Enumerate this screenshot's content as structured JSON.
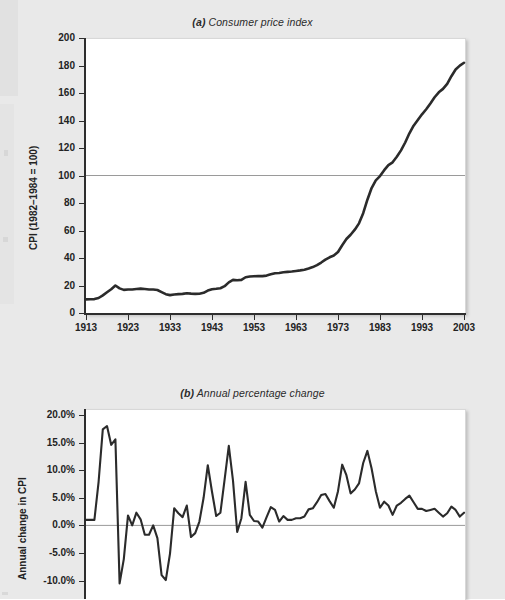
{
  "page": {
    "background_color": "#e9e9e9",
    "plot_background_color": "#ffffff",
    "line_color": "#2b2b2b",
    "reference_line_color": "#9a9a9a"
  },
  "figures": [
    {
      "id": "figure-a",
      "label": "(a)",
      "title": "Consumer price index",
      "title_full": "(a) Consumer price index",
      "ylabel": "CPI (1982–1984 = 100)",
      "xlabel": "",
      "yticks": [
        "0",
        "20",
        "40",
        "60",
        "80",
        "100",
        "120",
        "140",
        "160",
        "180",
        "200"
      ],
      "xticks": [
        "1913",
        "1923",
        "1933",
        "1943",
        "1953",
        "1963",
        "1973",
        "1983",
        "1993",
        "2003"
      ]
    },
    {
      "id": "figure-b",
      "label": "(b)",
      "title": "Annual percentage change",
      "title_full": "(b) Annual percentage change",
      "ylabel": "Annual change in CPI",
      "xlabel": "",
      "yticks": [
        "-10.0%",
        "-5.0%",
        "0.0%",
        "5.0%",
        "10.0%",
        "15.0%",
        "20.0%"
      ],
      "xticks": []
    }
  ],
  "chart_data": [
    {
      "type": "line",
      "title": "(a) Consumer price index",
      "xlabel": "",
      "ylabel": "CPI (1982-1984 = 100)",
      "xlim": [
        1913,
        2003
      ],
      "ylim": [
        0,
        200
      ],
      "ytick_step": 20,
      "xtick_step": 10,
      "grid": false,
      "legend": "none",
      "annotations": [
        {
          "type": "reference_line",
          "axis": "y",
          "value": 100,
          "color": "#9a9a9a"
        }
      ],
      "x": [
        1913,
        1914,
        1915,
        1916,
        1917,
        1918,
        1919,
        1920,
        1921,
        1922,
        1923,
        1924,
        1925,
        1926,
        1927,
        1928,
        1929,
        1930,
        1931,
        1932,
        1933,
        1934,
        1935,
        1936,
        1937,
        1938,
        1939,
        1940,
        1941,
        1942,
        1943,
        1944,
        1945,
        1946,
        1947,
        1948,
        1949,
        1950,
        1951,
        1952,
        1953,
        1954,
        1955,
        1956,
        1957,
        1958,
        1959,
        1960,
        1961,
        1962,
        1963,
        1964,
        1965,
        1966,
        1967,
        1968,
        1969,
        1970,
        1971,
        1972,
        1973,
        1974,
        1975,
        1976,
        1977,
        1978,
        1979,
        1980,
        1981,
        1982,
        1983,
        1984,
        1985,
        1986,
        1987,
        1988,
        1989,
        1990,
        1991,
        1992,
        1993,
        1994,
        1995,
        1996,
        1997,
        1998,
        1999,
        2000,
        2001,
        2002,
        2003
      ],
      "y": [
        9.9,
        10.0,
        10.1,
        10.9,
        12.8,
        15.1,
        17.3,
        20.0,
        17.9,
        16.8,
        17.1,
        17.1,
        17.5,
        17.7,
        17.4,
        17.1,
        17.1,
        16.7,
        15.2,
        13.7,
        13.0,
        13.4,
        13.7,
        13.9,
        14.4,
        14.1,
        13.9,
        14.0,
        14.7,
        16.3,
        17.3,
        17.6,
        18.0,
        19.5,
        22.3,
        24.1,
        23.8,
        24.1,
        26.0,
        26.5,
        26.7,
        26.9,
        26.8,
        27.2,
        28.1,
        28.9,
        29.1,
        29.6,
        29.9,
        30.2,
        30.6,
        31.0,
        31.5,
        32.4,
        33.4,
        34.8,
        36.7,
        38.8,
        40.5,
        41.8,
        44.4,
        49.3,
        53.8,
        56.9,
        60.6,
        65.2,
        72.6,
        82.4,
        90.9,
        96.5,
        99.6,
        103.9,
        107.6,
        109.6,
        113.6,
        118.3,
        124.0,
        130.7,
        136.2,
        140.3,
        144.5,
        148.2,
        152.4,
        156.9,
        160.5,
        163.0,
        166.6,
        172.2,
        177.1,
        179.9,
        182.0
      ]
    },
    {
      "type": "line",
      "title": "(b) Annual percentage change",
      "xlabel": "",
      "ylabel": "Annual change in CPI",
      "xlim": [
        1913,
        2003
      ],
      "ylim": [
        -0.125,
        0.215
      ],
      "ytick_step": 0.05,
      "grid": false,
      "legend": "none",
      "annotations": [
        {
          "type": "reference_line",
          "axis": "y",
          "value": 0,
          "color": "#9a9a9a"
        }
      ],
      "x": [
        1913,
        1914,
        1915,
        1916,
        1917,
        1918,
        1919,
        1920,
        1921,
        1922,
        1923,
        1924,
        1925,
        1926,
        1927,
        1928,
        1929,
        1930,
        1931,
        1932,
        1933,
        1934,
        1935,
        1936,
        1937,
        1938,
        1939,
        1940,
        1941,
        1942,
        1943,
        1944,
        1945,
        1946,
        1947,
        1948,
        1949,
        1950,
        1951,
        1952,
        1953,
        1954,
        1955,
        1956,
        1957,
        1958,
        1959,
        1960,
        1961,
        1962,
        1963,
        1964,
        1965,
        1966,
        1967,
        1968,
        1969,
        1970,
        1971,
        1972,
        1973,
        1974,
        1975,
        1976,
        1977,
        1978,
        1979,
        1980,
        1981,
        1982,
        1983,
        1984,
        1985,
        1986,
        1987,
        1988,
        1989,
        1990,
        1991,
        1992,
        1993,
        1994,
        1995,
        1996,
        1997,
        1998,
        1999,
        2000,
        2001,
        2002,
        2003
      ],
      "y_percent": [
        1.0,
        1.0,
        1.0,
        7.9,
        17.4,
        18.0,
        14.6,
        15.6,
        -10.5,
        -6.1,
        1.8,
        0.0,
        2.3,
        1.1,
        -1.7,
        -1.7,
        0.0,
        -2.3,
        -9.0,
        -9.9,
        -5.1,
        3.1,
        2.2,
        1.5,
        3.6,
        -2.1,
        -1.4,
        0.7,
        5.0,
        10.9,
        6.1,
        1.7,
        2.3,
        8.3,
        14.4,
        8.1,
        -1.2,
        1.3,
        7.9,
        1.9,
        0.8,
        0.7,
        -0.4,
        1.5,
        3.3,
        2.8,
        0.7,
        1.7,
        1.0,
        1.0,
        1.3,
        1.3,
        1.6,
        2.9,
        3.1,
        4.2,
        5.5,
        5.7,
        4.4,
        3.2,
        6.2,
        11.0,
        9.1,
        5.8,
        6.5,
        7.6,
        11.3,
        13.5,
        10.3,
        6.2,
        3.2,
        4.3,
        3.6,
        1.9,
        3.6,
        4.1,
        4.8,
        5.4,
        4.2,
        3.0,
        3.0,
        2.6,
        2.8,
        3.0,
        2.3,
        1.6,
        2.2,
        3.4,
        2.8,
        1.6,
        2.3
      ]
    }
  ]
}
